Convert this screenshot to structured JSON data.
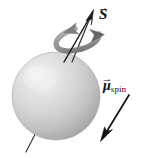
{
  "figure": {
    "name": "electron-spin-magnetic-moment-diagram",
    "background_color": "#ffffff",
    "width": 145,
    "height": 158
  },
  "sphere": {
    "name": "spinning-sphere",
    "center_x": 56,
    "center_y": 96,
    "radius": 44,
    "highlight_x": 38,
    "highlight_y": 76,
    "color_light": "#ededed",
    "color_mid": "#d2d2d2",
    "color_dark": "#a6a6a6",
    "edge_color": "#9a9a9a"
  },
  "spin_axis": {
    "name": "rotation-axis-line",
    "color": "#2a2a2a",
    "top_x": 92,
    "top_y": 12,
    "bottom_x": 26,
    "bottom_y": 152
  },
  "vectors": [
    {
      "id": "spin-angular-momentum",
      "symbol": "S",
      "subscript": "",
      "has_overarrow": true,
      "label_text": "S",
      "color": "#1a1a1a",
      "tail_x": 64,
      "tail_y": 62,
      "head_x": 92,
      "head_y": 12,
      "description": "spin angular momentum vector pointing up and to the right along the rotation axis"
    },
    {
      "id": "spin-magnetic-moment",
      "symbol": "μ",
      "subscript": "spin",
      "has_overarrow": true,
      "label_text": "μ spin",
      "color": "#111111",
      "tail_x": 129,
      "tail_y": 95,
      "head_x": 102,
      "head_y": 139,
      "description": "magnetic dipole moment vector pointing down and to the left, antiparallel to spin"
    }
  ],
  "rotation_indicator": {
    "name": "rotation-curved-arrow",
    "color": "#8c8c8c",
    "stroke_color": "#7a7a7a",
    "center_x": 78,
    "center_y": 39,
    "rx": 22,
    "ry": 10,
    "tilt_degrees": -16,
    "arrowheads": 2,
    "direction": "counterclockwise-about-axis",
    "description": "grey elliptical band with two arrowheads encircling the spin axis indicating rotation"
  },
  "labels": {
    "spin_vector": {
      "symbol": "S",
      "arrow_glyph": "→",
      "subscript": ""
    },
    "moment_vector": {
      "symbol": "μ",
      "arrow_glyph": "→",
      "subscript": "spin"
    }
  }
}
